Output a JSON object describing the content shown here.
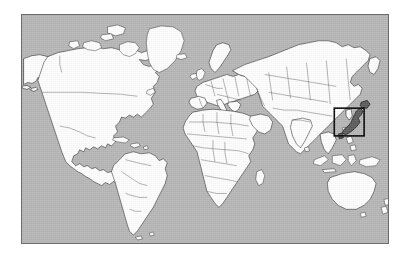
{
  "figure": {
    "kind": "world-map",
    "projection": "equirectangular",
    "background_color": "#ffffff",
    "caption": ""
  },
  "map": {
    "frame": {
      "x": 21,
      "y": 14,
      "width": 368,
      "height": 230,
      "border_color": "#6b6b6b"
    },
    "ocean_color": "#b5b5b5",
    "land_color": "#fdfdfd",
    "coastline_color": "#1d1d1d",
    "country_border_color": "#3a3a3a",
    "extent": {
      "lon_min": -180,
      "lon_max": 180,
      "lat_min": -62,
      "lat_max": 84
    },
    "features_shown": [
      "North America",
      "Greenland",
      "South America",
      "Europe",
      "Africa",
      "Asia",
      "Australia",
      "New Zealand",
      "Indonesia",
      "Japan",
      "Iceland",
      "Madagascar",
      "United Kingdom",
      "Philippines",
      "Papua New Guinea"
    ],
    "country_borders_visible": true,
    "graticule_visible": false
  },
  "highlight": {
    "label": "Japan",
    "shape": "rectangle",
    "box_color": "#000000",
    "box_line_width": 1.6,
    "region_fill_color": "#5a5a5a",
    "box_pixels": {
      "x": 335,
      "y": 108,
      "width": 30,
      "height": 28
    },
    "box_degrees": {
      "lon_min": 126,
      "lon_max": 155,
      "lat_min": 28,
      "lat_max": 46
    }
  },
  "annotations": {
    "title": "",
    "legend": "",
    "scale_bar": "",
    "axis_labels": []
  }
}
